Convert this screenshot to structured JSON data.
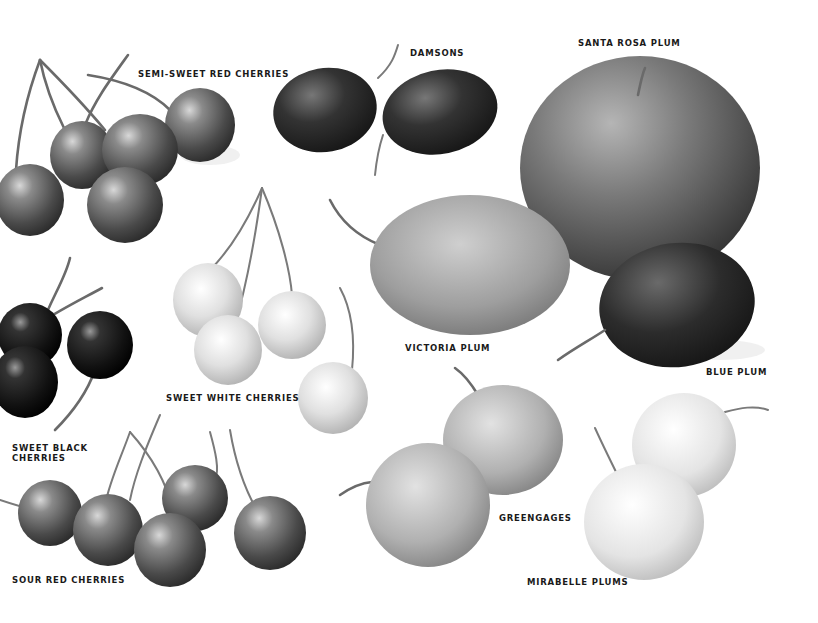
{
  "illustration": {
    "title": "Cherries and Plums",
    "labels": [
      {
        "id": "semi-sweet-red-cherries",
        "text": "SEMI-SWEET RED CHERRIES",
        "x": 138,
        "y": 69
      },
      {
        "id": "damsons",
        "text": "DAMSONS",
        "x": 410,
        "y": 48
      },
      {
        "id": "santa-rosa-plum",
        "text": "SANTA ROSA PLUM",
        "x": 578,
        "y": 38
      },
      {
        "id": "victoria-plum",
        "text": "VICTORIA PLUM",
        "x": 405,
        "y": 343
      },
      {
        "id": "blue-plum",
        "text": "BLUE PLUM",
        "x": 706,
        "y": 367
      },
      {
        "id": "sweet-white-cherries",
        "text": "SWEET WHITE CHERRIES",
        "x": 166,
        "y": 393
      },
      {
        "id": "sweet-black-cherries",
        "text": "SWEET BLACK\nCHERRIES",
        "x": 12,
        "y": 443
      },
      {
        "id": "greengages",
        "text": "GREENGAGES",
        "x": 499,
        "y": 513
      },
      {
        "id": "sour-red-cherries",
        "text": "SOUR RED CHERRIES",
        "x": 12,
        "y": 575
      },
      {
        "id": "mirabelle-plums",
        "text": "MIRABELLE PLUMS",
        "x": 527,
        "y": 577
      }
    ]
  },
  "colors": {
    "background": "#ffffff",
    "label": "#1a1a1a"
  }
}
